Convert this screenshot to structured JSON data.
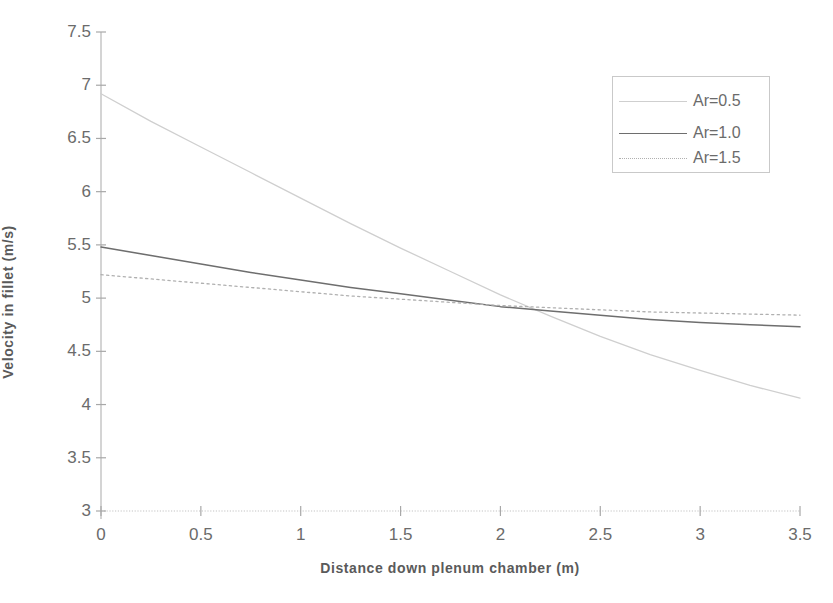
{
  "chart_data": {
    "type": "line",
    "title": "",
    "xlabel": "Distance down plenum chamber (m)",
    "ylabel": "Velocity in fillet (m/s)",
    "xlim": [
      0,
      3.5
    ],
    "ylim": [
      3,
      7.5
    ],
    "xticks": [
      "0",
      "0.5",
      "1",
      "1.5",
      "2",
      "2.5",
      "3",
      "3.5"
    ],
    "xtick_values": [
      0,
      0.5,
      1,
      1.5,
      2,
      2.5,
      3,
      3.5
    ],
    "yticks": [
      "3",
      "3.5",
      "4",
      "4.5",
      "5",
      "5.5",
      "6",
      "6.5",
      "7",
      "7.5"
    ],
    "ytick_values": [
      3,
      3.5,
      4,
      4.5,
      5,
      5.5,
      6,
      6.5,
      7,
      7.5
    ],
    "grid": false,
    "legend_position": "upper right",
    "x": [
      0,
      0.25,
      0.5,
      0.75,
      1,
      1.25,
      1.5,
      1.75,
      2,
      2.25,
      2.5,
      2.75,
      3,
      3.25,
      3.5
    ],
    "series": [
      {
        "name": "Ar=0.5",
        "color": "#cfcfcf",
        "style": "solid",
        "values": [
          6.92,
          6.66,
          6.42,
          6.18,
          5.94,
          5.7,
          5.47,
          5.25,
          5.03,
          4.83,
          4.64,
          4.47,
          4.32,
          4.18,
          4.06
        ]
      },
      {
        "name": "Ar=1.0",
        "color": "#6e6e6e",
        "style": "solid",
        "values": [
          5.48,
          5.4,
          5.32,
          5.24,
          5.17,
          5.1,
          5.04,
          4.98,
          4.92,
          4.88,
          4.84,
          4.8,
          4.77,
          4.75,
          4.73
        ]
      },
      {
        "name": "Ar=1.5",
        "color": "#b0b0b0",
        "style": "dotted",
        "values": [
          5.22,
          5.18,
          5.14,
          5.1,
          5.06,
          5.02,
          4.99,
          4.96,
          4.93,
          4.91,
          4.89,
          4.87,
          4.86,
          4.85,
          4.84
        ]
      }
    ]
  },
  "legend": {
    "items": [
      {
        "label": "Ar=0.5"
      },
      {
        "label": "Ar=1.0"
      },
      {
        "label": "Ar=1.5"
      }
    ]
  },
  "axes": {
    "x_title": "Distance down plenum chamber (m)",
    "y_title": "Velocity in fillet (m/s)"
  }
}
